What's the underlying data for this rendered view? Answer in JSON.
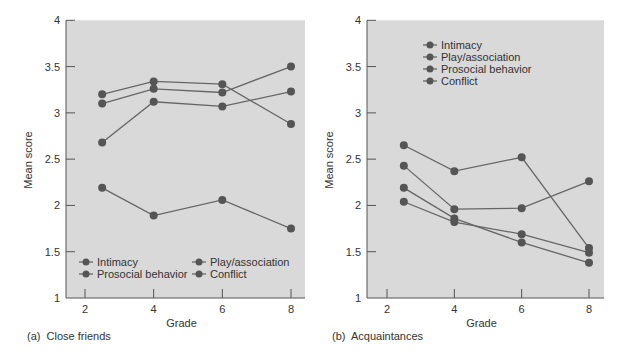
{
  "chart_data": [
    {
      "type": "line",
      "panel_label": "(a)  Close friends",
      "title": "Close friends",
      "xlabel": "Grade",
      "ylabel": "Mean score",
      "xlim": [
        1.4,
        8.4
      ],
      "ylim": [
        1,
        4
      ],
      "x_ticks": [
        2,
        4,
        6,
        8
      ],
      "y_ticks": [
        1,
        1.5,
        2,
        2.5,
        3,
        3.5,
        4
      ],
      "y_tick_labels": [
        "1",
        "1.5",
        "2",
        "2.5",
        "3",
        "3.5",
        "4"
      ],
      "grid": false,
      "x": [
        2.5,
        4,
        6,
        8
      ],
      "legend_position": "lower, two columns",
      "legend_order": [
        "Intimacy",
        "Play/association",
        "Prosocial behavior",
        "Conflict"
      ],
      "series": [
        {
          "name": "Intimacy",
          "values": [
            2.68,
            3.12,
            3.07,
            3.23
          ]
        },
        {
          "name": "Play/association",
          "values": [
            3.2,
            3.34,
            3.31,
            2.88
          ]
        },
        {
          "name": "Prosocial behavior",
          "values": [
            3.1,
            3.26,
            3.22,
            3.5
          ]
        },
        {
          "name": "Conflict",
          "values": [
            2.19,
            1.89,
            2.06,
            1.75
          ]
        }
      ]
    },
    {
      "type": "line",
      "panel_label": "(b)  Acquaintances",
      "title": "Acquaintances",
      "xlabel": "Grade",
      "ylabel": "Mean score",
      "xlim": [
        1.4,
        8.4
      ],
      "ylim": [
        1,
        4
      ],
      "x_ticks": [
        2,
        4,
        6,
        8
      ],
      "y_ticks": [
        1,
        1.5,
        2,
        2.5,
        3,
        3.5,
        4
      ],
      "y_tick_labels": [
        "1",
        "1.5",
        "2",
        "2.5",
        "3",
        "3.5",
        "4"
      ],
      "grid": false,
      "x": [
        2.5,
        4,
        6,
        8
      ],
      "legend_position": "upper, single column",
      "legend_order": [
        "Intimacy",
        "Play/association",
        "Prosocial behavior",
        "Conflict"
      ],
      "series": [
        {
          "name": "Intimacy",
          "values": [
            2.65,
            2.37,
            2.52,
            1.54
          ]
        },
        {
          "name": "Play/association",
          "values": [
            2.43,
            1.96,
            1.97,
            2.26
          ]
        },
        {
          "name": "Prosocial behavior",
          "values": [
            2.19,
            1.86,
            1.6,
            1.38
          ]
        },
        {
          "name": "Conflict",
          "values": [
            2.04,
            1.82,
            1.69,
            1.49
          ]
        }
      ]
    }
  ],
  "colors": {
    "plot_background": "#d9d9d9",
    "axis": "#555555",
    "line": "#666666",
    "marker": "#555555",
    "text": "#333333"
  },
  "captions": {
    "left": "(a)  Close friends",
    "right": "(b)  Acquaintances"
  }
}
